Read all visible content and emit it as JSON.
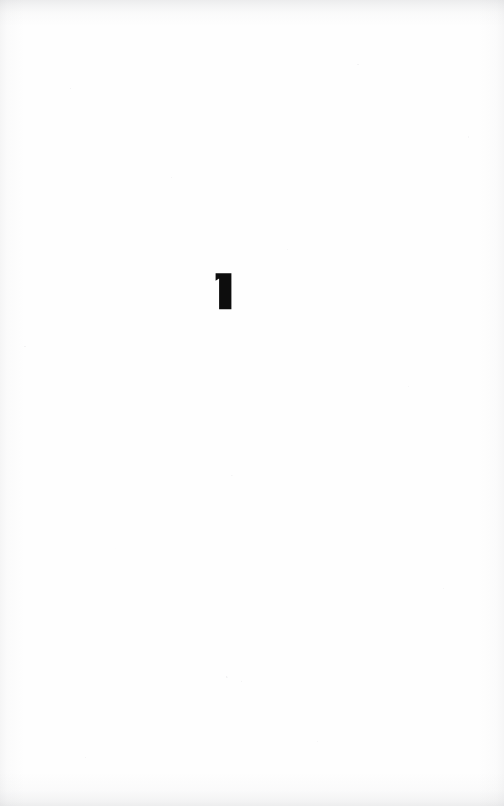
{
  "document": {
    "kind": "scanned-book-page",
    "page_width": 504,
    "page_height": 806,
    "paper_color": "#fefefe",
    "ink_color": "#0d0d0d"
  },
  "content": {
    "chapter_number": "1",
    "chapter_number_name": "chapter-number",
    "glyph_style": "bold-serif-numeral",
    "position_hint": "upper-middle, slightly left of center"
  },
  "artifacts": {
    "top_edge_band": "scan-shadow",
    "bottom_edge_band": "scan-shadow",
    "left_edge_band": "scan-shadow",
    "right_edge_band": "scan-shadow",
    "speckles": "paper-grain"
  }
}
